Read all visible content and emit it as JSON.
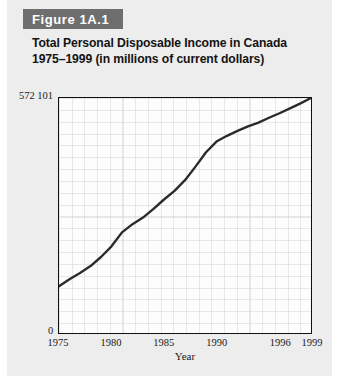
{
  "figure": {
    "banner_label": "Figure 1A.1",
    "title_line1": "Total Personal Disposable Income in Canada",
    "title_line2": "1975–1999 (in millions of current dollars)"
  },
  "colors": {
    "card_background": "#ededed",
    "banner_background": "#6e6e6e",
    "banner_text": "#ffffff",
    "plot_background": "#fdfdfd",
    "frame": "#101010",
    "series_line": "#2b2b2b",
    "gridline": "#d6d6d6"
  },
  "chart_data": {
    "type": "line",
    "title": "Total Personal Disposable Income in Canada 1975–1999 (in millions of current dollars)",
    "xlabel": "Year",
    "ylabel": "Total personal disposable income",
    "ylim": [
      0,
      572101
    ],
    "ymax_label": "572 101",
    "ymin_label": "0",
    "xlim": [
      1975,
      1999
    ],
    "xticks": [
      1975,
      1980,
      1985,
      1990,
      1996,
      1999
    ],
    "xtick_labels": [
      "1975",
      "1980",
      "1985",
      "1990",
      "1996",
      "1999"
    ],
    "ytick_labels": [
      "0",
      "572 101"
    ],
    "grid": true,
    "legend": null,
    "series": [
      {
        "name": "Total personal disposable income",
        "x": [
          1975,
          1976,
          1977,
          1978,
          1979,
          1980,
          1981,
          1982,
          1983,
          1984,
          1985,
          1986,
          1987,
          1988,
          1989,
          1990,
          1991,
          1992,
          1993,
          1994,
          1995,
          1996,
          1997,
          1998,
          1999
        ],
        "values": [
          114000,
          131000,
          146000,
          163000,
          185000,
          211000,
          245000,
          265000,
          281000,
          302000,
          325000,
          346000,
          372000,
          405000,
          440000,
          466000,
          480000,
          492000,
          503000,
          512000,
          524000,
          535000,
          547000,
          559000,
          572101
        ]
      }
    ]
  }
}
